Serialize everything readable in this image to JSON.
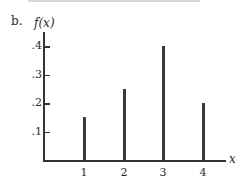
{
  "part_label": "b.",
  "chart_data": {
    "type": "bar",
    "title": "",
    "xlabel": "x",
    "ylabel": "f(x)",
    "categories": [
      "1",
      "2",
      "3",
      "4"
    ],
    "x": [
      1,
      2,
      3,
      4
    ],
    "values": [
      0.15,
      0.25,
      0.4,
      0.2
    ],
    "yticks": [
      ".1",
      ".2",
      ".3",
      ".4"
    ],
    "xticks": [
      "1",
      "2",
      "3",
      "4"
    ],
    "ylim": [
      0,
      0.45
    ],
    "grid": false,
    "legend": null,
    "style": "vertical line (spike) plot"
  },
  "colors": {
    "ink": "#333333",
    "background": "#ffffff"
  }
}
